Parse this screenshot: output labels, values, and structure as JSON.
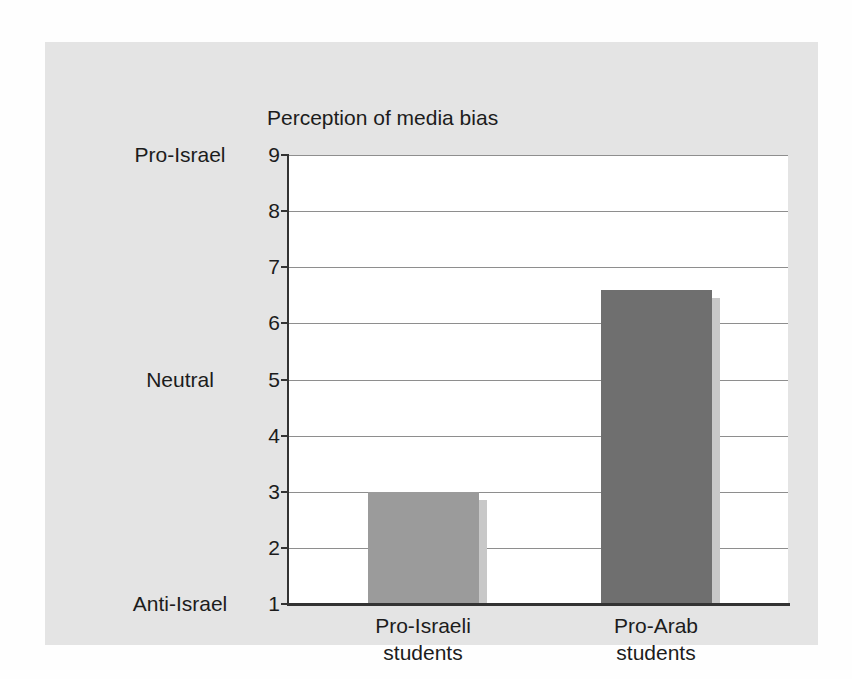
{
  "chart_data": {
    "type": "bar",
    "title": "Perception of media bias",
    "categories": [
      {
        "lines": [
          "Pro-Israeli",
          "students"
        ],
        "name": "pro-israeli-students"
      },
      {
        "lines": [
          "Pro-Arab",
          "students"
        ],
        "name": "pro-arab-students"
      }
    ],
    "values": [
      3.0,
      6.6
    ],
    "bar_colors": [
      "#9b9b9b",
      "#6f6f6f"
    ],
    "bar_shadow_color": "#c8c8c8",
    "ylim": [
      1,
      9
    ],
    "yticks": [
      1,
      2,
      3,
      4,
      5,
      6,
      7,
      8,
      9
    ],
    "scale_labels": [
      {
        "value": 9,
        "label": "Pro-Israel"
      },
      {
        "value": 5,
        "label": "Neutral"
      },
      {
        "value": 1,
        "label": "Anti-Israel"
      }
    ],
    "grid": true,
    "legend": false,
    "plot_background": "#ffffff",
    "panel_background": "#e4e4e4",
    "gridline_color": "#8e8e8e",
    "axis_color": "#333333",
    "text_color": "#1c1c1c"
  }
}
